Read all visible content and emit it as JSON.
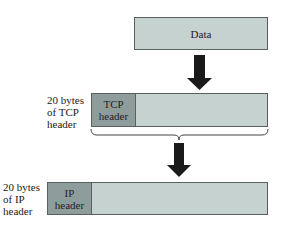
{
  "diagram": {
    "type": "encapsulation",
    "colors": {
      "payload_fill": "#c5d2d0",
      "header_fill": "#8e9d9c",
      "border": "#5a5f60",
      "arrow": "#1a1a1a"
    },
    "data_block": {
      "label": "Data"
    },
    "tcp_segment": {
      "header_label_line1": "TCP",
      "header_label_line2": "header",
      "side_label": [
        "20 bytes",
        "of TCP",
        "header"
      ]
    },
    "ip_datagram": {
      "header_label_line1": "IP",
      "header_label_line2": "header",
      "side_label": [
        "20 bytes",
        "of IP",
        "header"
      ]
    }
  }
}
